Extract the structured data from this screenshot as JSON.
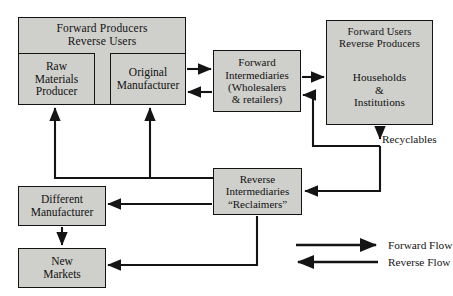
{
  "diagram": {
    "groups": [
      {
        "id": "producers",
        "header_line1": "Forward  Producers",
        "header_line2": "Reverse  Users"
      },
      {
        "id": "users",
        "header_line1": "Forward  Users",
        "header_line2": "Reverse  Producers"
      }
    ],
    "boxes": [
      {
        "id": "raw-materials-producer",
        "line1": "Raw",
        "line2": "Materials",
        "line3": "Producer"
      },
      {
        "id": "original-manufacturer",
        "line1": "Original",
        "line2": "Manufacturer",
        "line3": ""
      },
      {
        "id": "forward-intermediaries",
        "line1": "Forward",
        "line2": "Intermediaries",
        "line3": "(Wholesalers",
        "line4": "& retailers)"
      },
      {
        "id": "households-institutions",
        "line1": "Households",
        "line2": "&",
        "line3": "Institutions"
      },
      {
        "id": "reverse-intermediaries",
        "line1": "Reverse",
        "line2": "Intermediaries",
        "line3": "“Reclaimers”"
      },
      {
        "id": "different-manufacturer",
        "line1": "Different",
        "line2": "Manufacturer",
        "line3": ""
      },
      {
        "id": "new-markets",
        "line1": "New",
        "line2": "Markets",
        "line3": ""
      }
    ],
    "labels": {
      "recyclables": "Recyclables"
    },
    "legend": {
      "forward_flow": "Forward Flow",
      "reverse_flow": "Reverse Flow"
    },
    "colors": {
      "box_fill": "#cfcfcb",
      "box_stroke": "#141414",
      "arrow": "#141414",
      "background": "#ffffff"
    }
  }
}
